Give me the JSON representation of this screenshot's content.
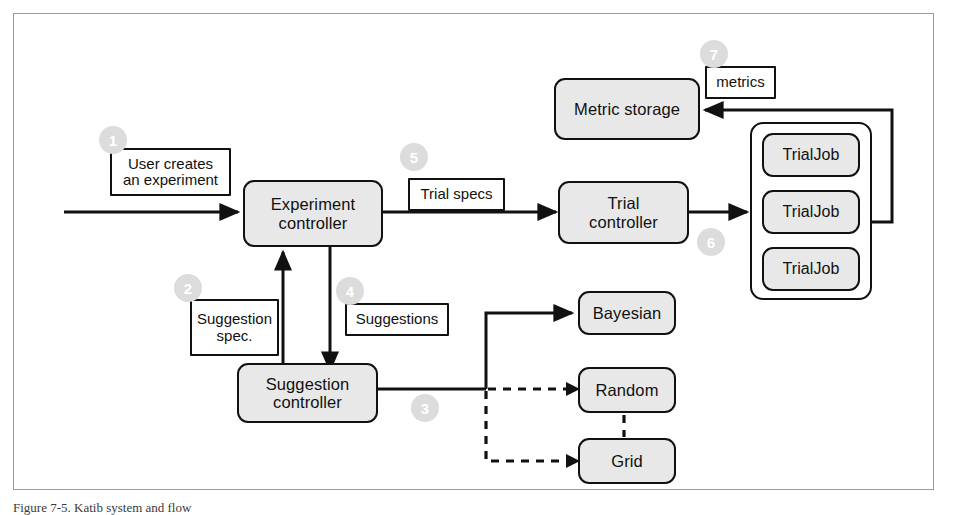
{
  "figure": {
    "caption": "Figure 7-5. Katib system and flow",
    "frame_border_color": "#9a9a9a",
    "node_fill": "#e8e8e8",
    "node_stroke": "#111111",
    "badge_fill": "#dcdcdc",
    "badge_text_color": "#ffffff"
  },
  "nodes": {
    "experiment_controller": "Experiment\ncontroller",
    "suggestion_controller": "Suggestion\ncontroller",
    "trial_controller": "Trial\ncontroller",
    "metric_storage": "Metric storage",
    "bayesian": "Bayesian",
    "random": "Random",
    "grid": "Grid",
    "trialjob_1": "TrialJob",
    "trialjob_2": "TrialJob",
    "trialjob_3": "TrialJob"
  },
  "labels": {
    "user_creates": "User creates\nan experiment",
    "suggestion_spec": "Suggestion\nspec.",
    "suggestions": "Suggestions",
    "trial_specs": "Trial specs",
    "metrics": "metrics"
  },
  "badges": [
    {
      "id": "badge-1",
      "number": "1",
      "near": "user-creates-an-experiment-label"
    },
    {
      "id": "badge-2",
      "number": "2",
      "near": "suggestion-spec-label"
    },
    {
      "id": "badge-3",
      "number": "3",
      "near": "suggestion-controller-to-algorithms"
    },
    {
      "id": "badge-4",
      "number": "4",
      "near": "suggestions-label"
    },
    {
      "id": "badge-5",
      "number": "5",
      "near": "trial-specs-label"
    },
    {
      "id": "badge-6",
      "number": "6",
      "near": "trial-controller-to-trialjobs"
    },
    {
      "id": "badge-7",
      "number": "7",
      "near": "metrics-label"
    }
  ],
  "edges": [
    {
      "id": "edge-user-to-experiment",
      "from": "user input",
      "to": "experiment controller",
      "style": "solid",
      "arrow": true
    },
    {
      "id": "edge-experiment-to-trial",
      "from": "experiment controller",
      "to": "trial controller",
      "style": "solid",
      "arrow": true
    },
    {
      "id": "edge-experiment-to-suggestion",
      "from": "experiment controller",
      "to": "suggestion controller",
      "style": "solid",
      "arrow": true
    },
    {
      "id": "edge-suggestion-to-experiment",
      "from": "suggestion controller",
      "to": "experiment controller",
      "style": "solid",
      "arrow": true
    },
    {
      "id": "edge-suggestion-to-bayesian",
      "from": "suggestion controller",
      "to": "Bayesian",
      "style": "solid",
      "arrow": true
    },
    {
      "id": "edge-suggestion-to-random",
      "from": "suggestion controller",
      "to": "Random",
      "style": "dashed",
      "arrow": true
    },
    {
      "id": "edge-suggestion-to-grid",
      "from": "suggestion controller",
      "to": "Grid",
      "style": "dashed",
      "arrow": true
    },
    {
      "id": "edge-random-to-grid",
      "from": "Random",
      "to": "Grid",
      "style": "dashed",
      "arrow": false
    },
    {
      "id": "edge-trial-to-trialjobs",
      "from": "trial controller",
      "to": "TrialJob group",
      "style": "solid",
      "arrow": true
    },
    {
      "id": "edge-trialjobs-to-metricstorage",
      "from": "TrialJob group",
      "to": "metric storage",
      "style": "solid",
      "arrow": true
    }
  ]
}
